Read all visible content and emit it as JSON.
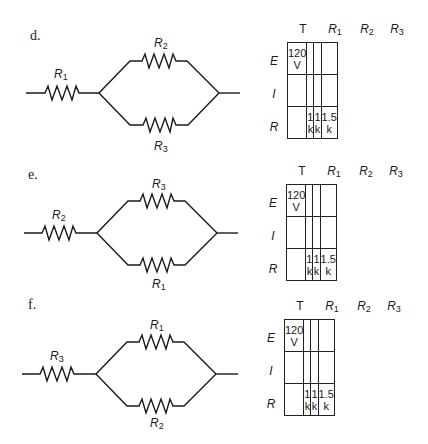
{
  "problems": [
    {
      "label": "d.",
      "series_resistor": {
        "name": "R",
        "sub": "1"
      },
      "upper_resistor": {
        "name": "R",
        "sub": "2"
      },
      "lower_resistor": {
        "name": "R",
        "sub": "3"
      },
      "table": {
        "columns": [
          {
            "name": "T",
            "sub": ""
          },
          {
            "name": "R",
            "sub": "1"
          },
          {
            "name": "R",
            "sub": "2"
          },
          {
            "name": "R",
            "sub": "3"
          }
        ],
        "rows": [
          {
            "label": "E",
            "cells": [
              "120 V",
              "",
              "",
              ""
            ]
          },
          {
            "label": "I",
            "cells": [
              "",
              "",
              "",
              ""
            ]
          },
          {
            "label": "R",
            "cells": [
              "",
              "1 k",
              "1 k",
              "1.5 k"
            ]
          }
        ]
      }
    },
    {
      "label": "e.",
      "series_resistor": {
        "name": "R",
        "sub": "2"
      },
      "upper_resistor": {
        "name": "R",
        "sub": "3"
      },
      "lower_resistor": {
        "name": "R",
        "sub": "1"
      },
      "table": {
        "columns": [
          {
            "name": "T",
            "sub": ""
          },
          {
            "name": "R",
            "sub": "1"
          },
          {
            "name": "R",
            "sub": "2"
          },
          {
            "name": "R",
            "sub": "3"
          }
        ],
        "rows": [
          {
            "label": "E",
            "cells": [
              "120 V",
              "",
              "",
              ""
            ]
          },
          {
            "label": "I",
            "cells": [
              "",
              "",
              "",
              ""
            ]
          },
          {
            "label": "R",
            "cells": [
              "",
              "1 k",
              "1 k",
              "1.5 k"
            ]
          }
        ]
      }
    },
    {
      "label": "f.",
      "series_resistor": {
        "name": "R",
        "sub": "3"
      },
      "upper_resistor": {
        "name": "R",
        "sub": "1"
      },
      "lower_resistor": {
        "name": "R",
        "sub": "2"
      },
      "table": {
        "columns": [
          {
            "name": "T",
            "sub": ""
          },
          {
            "name": "R",
            "sub": "1"
          },
          {
            "name": "R",
            "sub": "2"
          },
          {
            "name": "R",
            "sub": "3"
          }
        ],
        "rows": [
          {
            "label": "E",
            "cells": [
              "120 V",
              "",
              "",
              ""
            ]
          },
          {
            "label": "I",
            "cells": [
              "",
              "",
              "",
              ""
            ]
          },
          {
            "label": "R",
            "cells": [
              "",
              "1 k",
              "1 k",
              "1.5 k"
            ]
          }
        ]
      }
    }
  ]
}
